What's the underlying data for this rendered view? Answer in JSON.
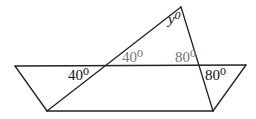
{
  "diagram": {
    "type": "geometry",
    "colors": {
      "line": "#222222",
      "label_dark": "#111111",
      "label_gray": "#777777"
    },
    "points": {
      "trap_top_left": [
        15,
        66
      ],
      "trap_top_right": [
        246,
        65
      ],
      "trap_bottom_left": [
        47,
        111
      ],
      "trap_bottom_right": [
        213,
        111
      ],
      "apex": [
        181,
        7
      ],
      "left_crossing": [
        106,
        65
      ],
      "right_crossing": [
        199,
        65
      ]
    },
    "labels": {
      "apex_angle": "y⁰",
      "left_lower_angle": "40⁰",
      "left_upper_angle": "40⁰",
      "right_upper_angle": "80⁰",
      "right_lower_angle": "80⁰"
    }
  }
}
